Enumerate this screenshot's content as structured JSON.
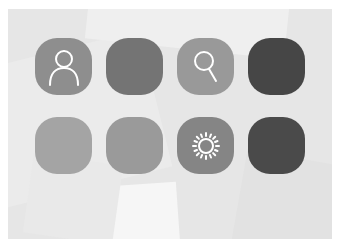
{
  "screen": {
    "background_color": "#e6e6e6"
  },
  "icons": [
    {
      "name": "user",
      "glyph": "person-outline",
      "color": "#8e8e8e",
      "row": 1,
      "col": 1
    },
    {
      "name": "blank-medium-1",
      "glyph": "",
      "color": "#747474",
      "row": 1,
      "col": 2
    },
    {
      "name": "search",
      "glyph": "magnifier",
      "color": "#999999",
      "row": 1,
      "col": 3
    },
    {
      "name": "blank-dark-1",
      "glyph": "",
      "color": "#464646",
      "row": 1,
      "col": 4
    },
    {
      "name": "blank-light-1",
      "glyph": "",
      "color": "#a4a4a4",
      "row": 2,
      "col": 1
    },
    {
      "name": "blank-light-2",
      "glyph": "",
      "color": "#9a9a9a",
      "row": 2,
      "col": 2
    },
    {
      "name": "settings-brightness",
      "glyph": "sun",
      "color": "#858585",
      "row": 2,
      "col": 3
    },
    {
      "name": "blank-dark-2",
      "glyph": "",
      "color": "#4a4a4a",
      "row": 2,
      "col": 4
    }
  ]
}
